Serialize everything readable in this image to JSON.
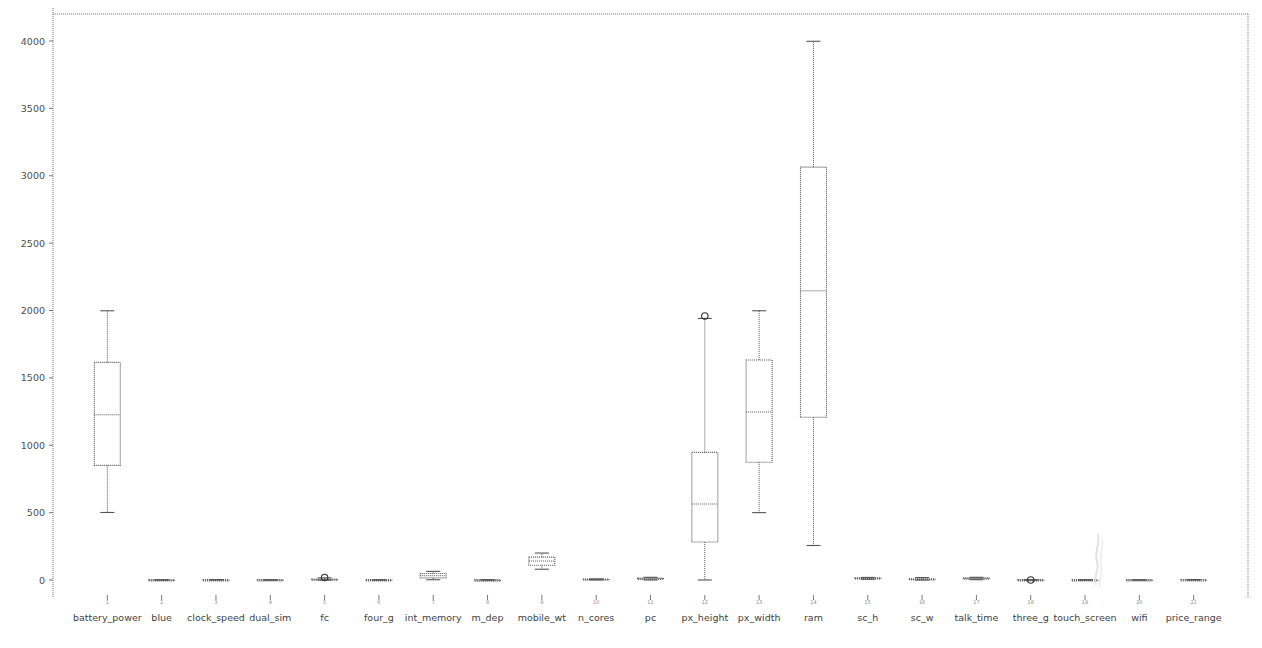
{
  "figure": {
    "background_color": "#ffffff",
    "line_color": "#555555",
    "axis_color": "#777777",
    "plot_area": {
      "left": 53,
      "top": 14,
      "right": 1248,
      "bottom": 595
    }
  },
  "chart_data": {
    "type": "box",
    "title": "",
    "xlabel": "",
    "ylabel": "",
    "ylim": [
      -260,
      4320
    ],
    "grid": false,
    "legend": null,
    "yticks": [
      0,
      500,
      1000,
      1500,
      2000,
      2500,
      3000,
      3500,
      4000
    ],
    "ytick_labels": [
      "0",
      "500",
      "1000",
      "1500",
      "2000",
      "2500",
      "3000",
      "3500",
      "4000"
    ],
    "categories": [
      "battery_power",
      "blue",
      "clock_speed",
      "dual_sim",
      "fc",
      "four_g",
      "int_memory",
      "m_dep",
      "mobile_wt",
      "n_cores",
      "pc",
      "px_height",
      "px_width",
      "ram",
      "sc_h",
      "sc_w",
      "talk_time",
      "three_g",
      "touch_screen",
      "wifi",
      "price_range"
    ],
    "xtick_indices": [
      "1",
      "2",
      "3",
      "4",
      "5",
      "6",
      "7",
      "8",
      "9",
      "10",
      "11",
      "12",
      "13",
      "14",
      "15",
      "16",
      "17",
      "18",
      "19",
      "20",
      "21"
    ],
    "boxes": [
      {
        "label": "battery_power",
        "whisker_low": 501,
        "q1": 851,
        "median": 1226,
        "q3": 1615,
        "whisker_high": 1998,
        "outliers": []
      },
      {
        "label": "blue",
        "whisker_low": 0,
        "q1": 0,
        "median": 0,
        "q3": 1,
        "whisker_high": 1,
        "outliers": []
      },
      {
        "label": "clock_speed",
        "whisker_low": 0.5,
        "q1": 0.7,
        "median": 1.5,
        "q3": 2.2,
        "whisker_high": 3.0,
        "outliers": []
      },
      {
        "label": "dual_sim",
        "whisker_low": 0,
        "q1": 0,
        "median": 1,
        "q3": 1,
        "whisker_high": 1,
        "outliers": []
      },
      {
        "label": "fc",
        "whisker_low": 0,
        "q1": 1,
        "median": 3,
        "q3": 7,
        "whisker_high": 16,
        "outliers": [
          19
        ]
      },
      {
        "label": "four_g",
        "whisker_low": 0,
        "q1": 0,
        "median": 1,
        "q3": 1,
        "whisker_high": 1,
        "outliers": []
      },
      {
        "label": "int_memory",
        "whisker_low": 2,
        "q1": 16,
        "median": 32,
        "q3": 48,
        "whisker_high": 64,
        "outliers": []
      },
      {
        "label": "m_dep",
        "whisker_low": 0.1,
        "q1": 0.2,
        "median": 0.5,
        "q3": 0.8,
        "whisker_high": 1.0,
        "outliers": []
      },
      {
        "label": "mobile_wt",
        "whisker_low": 80,
        "q1": 109,
        "median": 141,
        "q3": 170,
        "whisker_high": 200,
        "outliers": []
      },
      {
        "label": "n_cores",
        "whisker_low": 1,
        "q1": 2,
        "median": 4,
        "q3": 7,
        "whisker_high": 8,
        "outliers": []
      },
      {
        "label": "pc",
        "whisker_low": 0,
        "q1": 5,
        "median": 10,
        "q3": 15,
        "whisker_high": 20,
        "outliers": []
      },
      {
        "label": "px_height",
        "whisker_low": 0,
        "q1": 282,
        "median": 564,
        "q3": 947,
        "whisker_high": 1941,
        "outliers": [
          1960
        ]
      },
      {
        "label": "px_width",
        "whisker_low": 500,
        "q1": 874,
        "median": 1247,
        "q3": 1633,
        "whisker_high": 1998,
        "outliers": []
      },
      {
        "label": "ram",
        "whisker_low": 256,
        "q1": 1208,
        "median": 2146,
        "q3": 3064,
        "whisker_high": 3998,
        "outliers": []
      },
      {
        "label": "sc_h",
        "whisker_low": 5,
        "q1": 9,
        "median": 12,
        "q3": 16,
        "whisker_high": 19,
        "outliers": []
      },
      {
        "label": "sc_w",
        "whisker_low": 0,
        "q1": 2,
        "median": 5,
        "q3": 9,
        "whisker_high": 18,
        "outliers": []
      },
      {
        "label": "talk_time",
        "whisker_low": 2,
        "q1": 6,
        "median": 11,
        "q3": 16,
        "whisker_high": 20,
        "outliers": []
      },
      {
        "label": "three_g",
        "whisker_low": 0,
        "q1": 1,
        "median": 1,
        "q3": 1,
        "whisker_high": 1,
        "outliers": [
          0
        ]
      },
      {
        "label": "touch_screen",
        "whisker_low": 0,
        "q1": 0,
        "median": 1,
        "q3": 1,
        "whisker_high": 1,
        "outliers": []
      },
      {
        "label": "wifi",
        "whisker_low": 0,
        "q1": 0,
        "median": 1,
        "q3": 1,
        "whisker_high": 1,
        "outliers": []
      },
      {
        "label": "price_range",
        "whisker_low": 0,
        "q1": 0,
        "median": 1.5,
        "q3": 2,
        "whisker_high": 3,
        "outliers": []
      }
    ]
  }
}
